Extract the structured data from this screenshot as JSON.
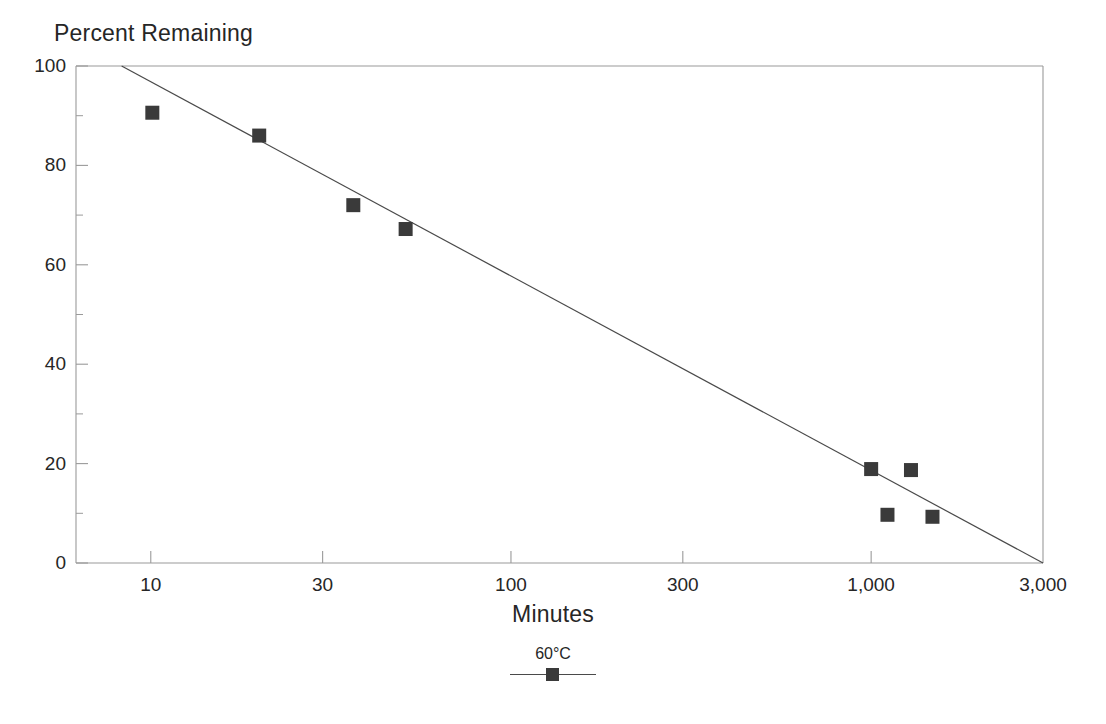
{
  "chart_data": {
    "type": "scatter",
    "title": "",
    "ylabel": "Percent Remaining",
    "xlabel": "Minutes",
    "xscale": "log",
    "yscale": "linear",
    "xlim": [
      6.2,
      3000
    ],
    "ylim": [
      0,
      100
    ],
    "grid": false,
    "frame": true,
    "legend_position": "below-plot",
    "xticks": [
      {
        "value": 10,
        "label": "10"
      },
      {
        "value": 30,
        "label": "30"
      },
      {
        "value": 100,
        "label": "100"
      },
      {
        "value": 300,
        "label": "300"
      },
      {
        "value": 1000,
        "label": "1,000"
      },
      {
        "value": 3000,
        "label": "3,000"
      }
    ],
    "yticks": [
      {
        "value": 0,
        "label": "0"
      },
      {
        "value": 20,
        "label": "20"
      },
      {
        "value": 40,
        "label": "40"
      },
      {
        "value": 60,
        "label": "60"
      },
      {
        "value": 80,
        "label": "80"
      },
      {
        "value": 100,
        "label": "100"
      }
    ],
    "yticks_minor": [
      10,
      30,
      50,
      70,
      90
    ],
    "series": [
      {
        "name": "60°C",
        "marker": "filled-square",
        "marker_color": "#3a3a3a",
        "marker_size": 14,
        "line_color": "#4a4a4a",
        "points": [
          {
            "x": 10.1,
            "y": 90.6
          },
          {
            "x": 20.0,
            "y": 86.0
          },
          {
            "x": 36.5,
            "y": 72.0
          },
          {
            "x": 51.0,
            "y": 67.2
          },
          {
            "x": 1000.0,
            "y": 18.9
          },
          {
            "x": 1110.0,
            "y": 9.7
          },
          {
            "x": 1290.0,
            "y": 18.7
          },
          {
            "x": 1480.0,
            "y": 9.3
          }
        ],
        "fit_line": {
          "start": {
            "x": 8.3,
            "y": 100.0
          },
          "end": {
            "x": 3000.0,
            "y": 0.0
          }
        }
      }
    ],
    "legend": [
      {
        "label": "60°C",
        "marker": "filled-square",
        "marker_color": "#3a3a3a",
        "line_color": "#4a4a4a"
      }
    ],
    "colors": {
      "marker": "#3a3a3a",
      "line": "#4a4a4a",
      "frame": "#9a9a9a",
      "text": "#262626",
      "background": "#ffffff"
    }
  }
}
